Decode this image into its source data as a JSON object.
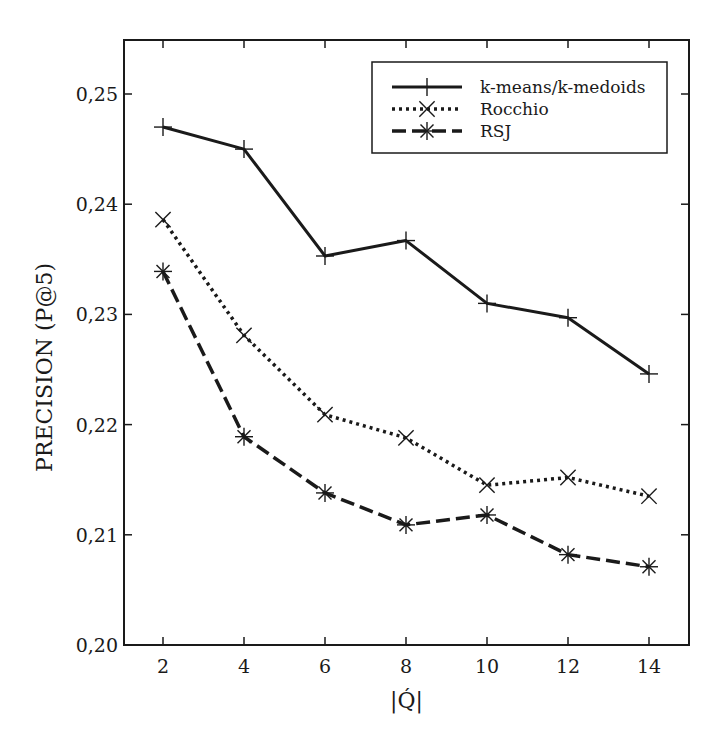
{
  "chart_data": {
    "type": "line",
    "title": "",
    "xlabel": "|Q́|",
    "ylabel": "PRECISION (P@5)",
    "x": [
      2,
      4,
      6,
      8,
      10,
      12,
      14
    ],
    "xticks": [
      "2",
      "4",
      "6",
      "8",
      "10",
      "12",
      "14"
    ],
    "xlim": [
      1,
      15
    ],
    "yticks": [
      "0,20",
      "0,21",
      "0,22",
      "0,23",
      "0,24",
      "0,25"
    ],
    "ytick_values": [
      0.2,
      0.21,
      0.22,
      0.23,
      0.24,
      0.25
    ],
    "ylim": [
      0.2,
      0.2549
    ],
    "grid": false,
    "legend_position": "top-right",
    "series": [
      {
        "name": "k-means/k-medoids",
        "style": "solid",
        "marker": "plus",
        "color": "#1a1a1a",
        "values": [
          0.247,
          0.245,
          0.2353,
          0.2367,
          0.231,
          0.2297,
          0.2246
        ]
      },
      {
        "name": "Rocchio",
        "style": "dotted",
        "marker": "x",
        "color": "#1a1a1a",
        "values": [
          0.2386,
          0.2281,
          0.2209,
          0.2188,
          0.2145,
          0.2152,
          0.2135
        ]
      },
      {
        "name": "RSJ",
        "style": "dashed",
        "marker": "star",
        "color": "#1a1a1a",
        "values": [
          0.2339,
          0.2189,
          0.2138,
          0.2109,
          0.2118,
          0.2082,
          0.2071
        ]
      }
    ]
  }
}
